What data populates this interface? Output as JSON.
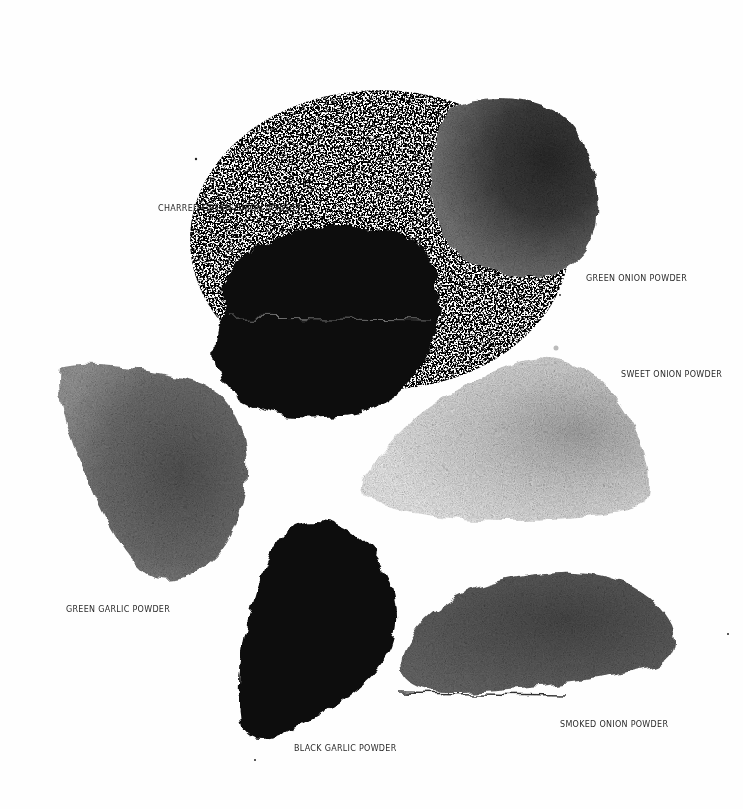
{
  "image": {
    "description": "Black-and-white overhead photograph of six piles of dried onion and garlic powders on a white surface, each with a hand-lettered label",
    "background_color": "#fefefe"
  },
  "piles": [
    {
      "id": "charred-green-onion",
      "label": "CHARRED GREEN ONION POWDER",
      "tone": "#0b0b0b",
      "label_pos": {
        "x": 158,
        "y": 203
      }
    },
    {
      "id": "green-onion",
      "label": "GREEN ONION POWDER",
      "tone": "#5a5a5a",
      "label_pos": {
        "x": 586,
        "y": 273
      }
    },
    {
      "id": "sweet-onion",
      "label": "SWEET ONION POWDER",
      "tone": "#d8d8d8",
      "label_pos": {
        "x": 621,
        "y": 369
      }
    },
    {
      "id": "green-garlic",
      "label": "GREEN GARLIC POWDER",
      "tone": "#6e6e6e",
      "label_pos": {
        "x": 66,
        "y": 604
      }
    },
    {
      "id": "black-garlic",
      "label": "BLACK GARLIC POWDER",
      "tone": "#0a0a0a",
      "label_pos": {
        "x": 294,
        "y": 743
      }
    },
    {
      "id": "smoked-onion",
      "label": "SMOKED ONION POWDER",
      "tone": "#555555",
      "label_pos": {
        "x": 560,
        "y": 719
      }
    }
  ]
}
